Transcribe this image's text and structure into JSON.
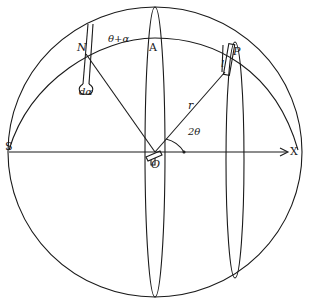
{
  "figure": {
    "type": "geometric diagram of a sphere with great circles and meridian ellipses",
    "colors": {
      "ink": "#1a1a1a",
      "background": "#ffffff"
    }
  },
  "labels": {
    "N": "N",
    "theta_plus_alpha": "θ+α",
    "A": "A",
    "d_alpha": "dα",
    "l": "l",
    "P": "P",
    "r": "r",
    "two_theta": "2θ",
    "S": "S",
    "O": "O",
    "X": "X"
  }
}
